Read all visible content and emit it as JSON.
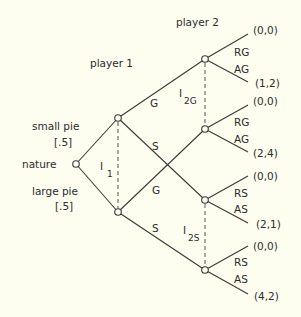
{
  "diagram": {
    "type": "extensive-form game tree",
    "players": {
      "nature": "nature",
      "player1": "player 1",
      "player2": "player 2"
    },
    "nature_moves": [
      {
        "label": "small pie",
        "prob": "[.5]"
      },
      {
        "label": "large pie",
        "prob": "[.5]"
      }
    ],
    "information_sets": {
      "I1": {
        "main": "I",
        "sub": "1"
      },
      "I2G": {
        "main": "I",
        "sub": "2G"
      },
      "I2S": {
        "main": "I",
        "sub": "2S"
      }
    },
    "player1_actions": [
      "G",
      "S",
      "G",
      "S"
    ],
    "player2_actions": {
      "g_top": [
        "RG",
        "AG"
      ],
      "g_bottom": [
        "RG",
        "AG"
      ],
      "s_top": [
        "RS",
        "AS"
      ],
      "s_bottom": [
        "RS",
        "AS"
      ]
    },
    "payoffs": [
      "(0,0)",
      "(1,2)",
      "(0,0)",
      "(2,4)",
      "(0,0)",
      "(2,1)",
      "(0,0)",
      "(4,2)"
    ]
  }
}
